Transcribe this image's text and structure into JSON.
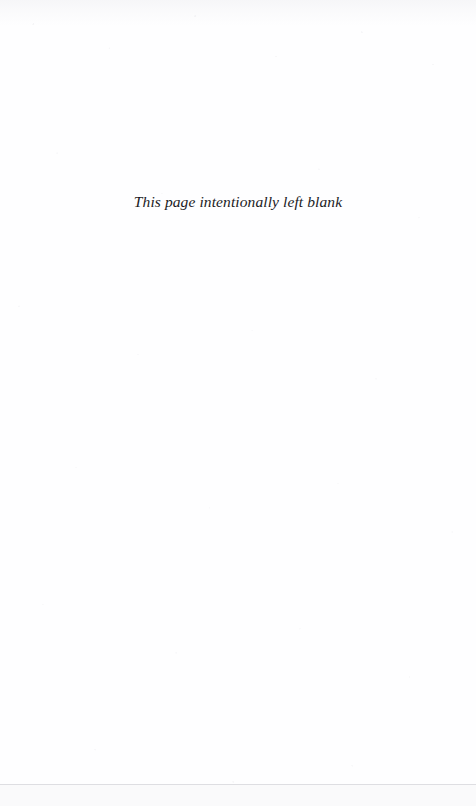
{
  "page": {
    "kind": "blank-page-notice",
    "width": 476,
    "height": 806,
    "paper_color": "#fefeff",
    "text_color": "#1b1b1e",
    "notice": "This page intentionally left blank"
  },
  "artifacts": {
    "scan_seam_color": "#969aa0",
    "top_edge_noise": "faint speckle",
    "seam_label": "scan-seam-line"
  }
}
